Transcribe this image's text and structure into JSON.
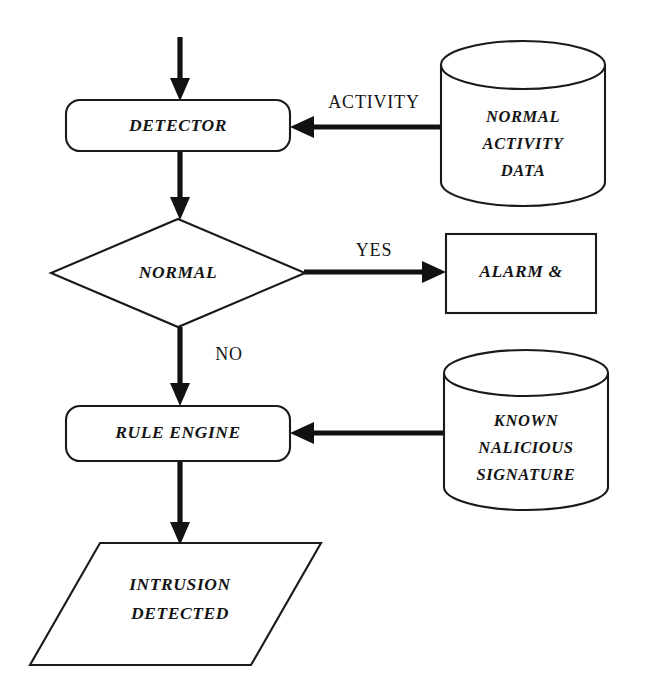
{
  "diagram": {
    "nodes": {
      "detector": {
        "label": "DETECTOR",
        "shape": "rounded-rectangle"
      },
      "normal_decision": {
        "label": "NORMAL",
        "shape": "diamond"
      },
      "alarm": {
        "label": "ALARM &",
        "shape": "rectangle"
      },
      "rule_engine": {
        "label": "RULE ENGINE",
        "shape": "rounded-rectangle"
      },
      "intrusion": {
        "label_line1": "INTRUSION",
        "label_line2": "DETECTED",
        "shape": "parallelogram"
      },
      "normal_activity_data": {
        "label_line1": "NORMAL",
        "label_line2": "ACTIVITY",
        "label_line3": "DATA",
        "shape": "cylinder"
      },
      "known_malicious_signature": {
        "label_line1": "KNOWN",
        "label_line2": "NALICIOUS",
        "label_line3": "SIGNATURE",
        "shape": "cylinder"
      }
    },
    "edges": {
      "activity": {
        "label": "ACTIVITY",
        "from": "normal_activity_data",
        "to": "detector"
      },
      "yes": {
        "label": "YES",
        "from": "normal_decision",
        "to": "alarm"
      },
      "no": {
        "label": "NO",
        "from": "normal_decision",
        "to": "rule_engine"
      },
      "entry": {
        "label": "",
        "from": "input",
        "to": "detector"
      },
      "detector_to_decision": {
        "label": "",
        "from": "detector",
        "to": "normal_decision"
      },
      "signature_to_rule": {
        "label": "",
        "from": "known_malicious_signature",
        "to": "rule_engine"
      },
      "rule_to_intrusion": {
        "label": "",
        "from": "rule_engine",
        "to": "intrusion"
      }
    },
    "colors": {
      "stroke": "#1a1a1a",
      "fill": "#ffffff",
      "connector": "#111111",
      "text": "#141414"
    }
  }
}
